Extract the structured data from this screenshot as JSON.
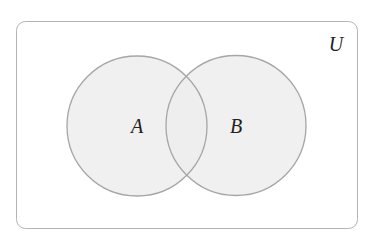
{
  "diagram": {
    "type": "venn",
    "universe": {
      "label": "U"
    },
    "sets": [
      {
        "label": "A"
      },
      {
        "label": "B"
      }
    ],
    "colors": {
      "background": "#ffffff",
      "border": "#b4b4b4",
      "circle_fill": "#ededed",
      "circle_stroke": "#a6a6a6",
      "text": "#222222"
    }
  }
}
